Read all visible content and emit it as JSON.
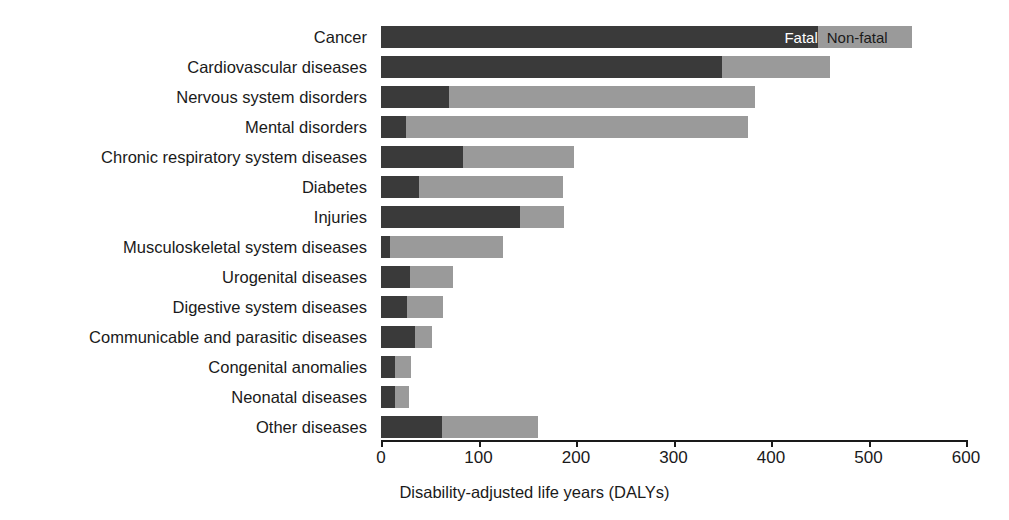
{
  "chart_data": {
    "type": "bar",
    "orientation": "horizontal",
    "stacked": true,
    "title": "",
    "xlabel": "Disability-adjusted life years (DALYs)",
    "ylabel": "",
    "xlim": [
      0,
      600
    ],
    "xticks": [
      0,
      100,
      200,
      300,
      400,
      500,
      600
    ],
    "xtick_labels": [
      "0",
      "100",
      "200",
      "300",
      "400",
      "500",
      "600"
    ],
    "grid": false,
    "legend_position": "inside-top-right-on-first-bar",
    "categories": [
      "Cancer",
      "Cardiovascular diseases",
      "Nervous system disorders",
      "Mental disorders",
      "Chronic respiratory system diseases",
      "Diabetes",
      "Injuries",
      "Musculoskeletal system diseases",
      "Urogenital diseases",
      "Digestive system diseases",
      "Communicable and parasitic diseases",
      "Congenital anomalies",
      "Neonatal diseases",
      "Other diseases"
    ],
    "series": [
      {
        "name": "Fatal",
        "color": "#3a3a3a",
        "values": [
          448,
          350,
          70,
          26,
          84,
          39,
          143,
          9,
          30,
          27,
          35,
          14,
          14,
          63
        ]
      },
      {
        "name": "Non-fatal",
        "color": "#9a9a9a",
        "values": [
          97,
          110,
          314,
          350,
          114,
          148,
          45,
          116,
          44,
          37,
          17,
          17,
          15,
          98
        ]
      }
    ],
    "totals": [
      545,
      460,
      384,
      376,
      198,
      187,
      188,
      125,
      74,
      64,
      52,
      31,
      29,
      161
    ]
  },
  "legend": {
    "items": [
      {
        "label": "Fatal",
        "color": "#3a3a3a",
        "text_color": "#ffffff"
      },
      {
        "label": "Non-fatal",
        "color": "#9a9a9a",
        "text_color": "#1a1a1a"
      }
    ]
  },
  "axis": {
    "x_title": "Disability-adjusted life years (DALYs)"
  }
}
